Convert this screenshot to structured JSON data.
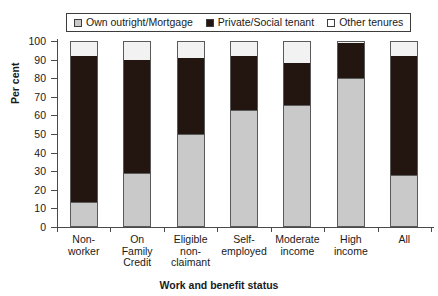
{
  "chart_data": {
    "type": "bar",
    "stacked": true,
    "title": "",
    "xlabel": "Work and benefit status",
    "ylabel": "Per cent",
    "ylim": [
      0,
      100
    ],
    "ytick_labels": [
      "0",
      "10",
      "20",
      "30",
      "40",
      "50",
      "60",
      "70",
      "80",
      "90",
      "100"
    ],
    "ytick_values": [
      0,
      10,
      20,
      30,
      40,
      50,
      60,
      70,
      80,
      90,
      100
    ],
    "grid": false,
    "legend_position": "top",
    "categories": [
      "Non-worker",
      "On Family Credit",
      "Eligible non-claimant",
      "Self-employed",
      "Moderate income",
      "High income",
      "All"
    ],
    "category_label_lines": [
      [
        "Non-worker"
      ],
      [
        "On",
        "Family",
        "Credit"
      ],
      [
        "Eligible",
        "non-",
        "claimant"
      ],
      [
        "Self-",
        "employed"
      ],
      [
        "Moderate",
        "income"
      ],
      [
        "High",
        "income"
      ],
      [
        "All"
      ]
    ],
    "series": [
      {
        "name": "Own outright/Mortgage",
        "color": "#c9c9c9",
        "values": [
          13.5,
          29,
          50,
          63,
          65.5,
          80,
          28
        ]
      },
      {
        "name": "Private/Social tenant",
        "color": "#231510",
        "values": [
          78.5,
          61,
          41,
          29,
          22.5,
          19,
          64
        ]
      },
      {
        "name": "Other tenures",
        "color": "#f2f2f2",
        "values": [
          8,
          10,
          9,
          8,
          12,
          1,
          8
        ]
      }
    ],
    "cumulative_tops": [
      [
        13.5,
        92,
        100
      ],
      [
        29,
        90,
        100
      ],
      [
        50,
        91,
        100
      ],
      [
        63,
        92,
        100
      ],
      [
        65.5,
        88,
        100
      ],
      [
        80,
        99,
        100
      ],
      [
        28,
        92,
        100
      ]
    ]
  },
  "legend": {
    "entries": [
      {
        "label": "Own outright/Mortgage",
        "swatch": "#c9c9c9"
      },
      {
        "label": "Private/Social tenant",
        "swatch": "#231510"
      },
      {
        "label": "Other tenures",
        "swatch": "#ffffff"
      }
    ]
  },
  "axes": {
    "y_title": "Per cent",
    "x_title": "Work and benefit status"
  }
}
